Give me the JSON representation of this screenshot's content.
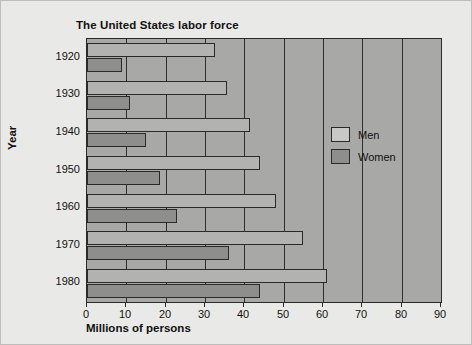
{
  "chart_data": {
    "type": "bar",
    "orientation": "horizontal",
    "title": "The United States labor force",
    "xlabel": "Millions of persons",
    "ylabel": "Year",
    "categories": [
      "1920",
      "1930",
      "1940",
      "1950",
      "1960",
      "1970",
      "1980"
    ],
    "series": [
      {
        "name": "Men",
        "color": "#b2b2b0",
        "values": [
          32.5,
          35.5,
          41.5,
          44.0,
          48.0,
          55.0,
          61.0
        ]
      },
      {
        "name": "Women",
        "color": "#8e8e8c",
        "values": [
          9.0,
          11.0,
          15.0,
          18.5,
          23.0,
          36.0,
          44.0
        ]
      }
    ],
    "xlim": [
      0,
      90
    ],
    "xticks": [
      0,
      10,
      20,
      30,
      40,
      50,
      60,
      70,
      80,
      90
    ],
    "xtick_labels": [
      "0",
      "10",
      "20",
      "30",
      "40",
      "50",
      "60",
      "70",
      "80",
      "90"
    ],
    "grid": true,
    "grid_axis": "x",
    "legend_position": "inside-right",
    "legend_entries": [
      "Men",
      "Women"
    ],
    "background": "#e9e9e7",
    "plot_background": "#a8a8a6"
  }
}
